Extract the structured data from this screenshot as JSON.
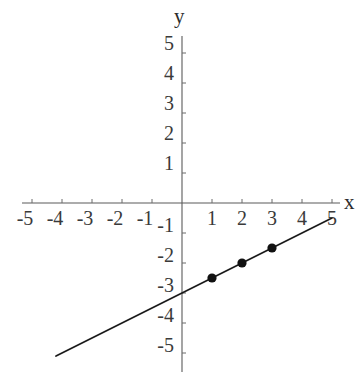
{
  "chart_data": {
    "type": "line",
    "title": "",
    "xlabel": "x",
    "ylabel": "y",
    "xlim": [
      -5,
      5
    ],
    "ylim": [
      -5,
      5
    ],
    "grid": false,
    "legend": "none",
    "equation": "y = 0.5x - 3",
    "slope": 0.5,
    "intercept": -3,
    "line_endpoints": [
      {
        "x": -4.2,
        "y": -5.1
      },
      {
        "x": 5.0,
        "y": -0.5
      }
    ],
    "x": [
      1,
      2,
      3
    ],
    "values": [
      -2.5,
      -2,
      -1.5
    ],
    "series": [
      {
        "name": "y = 0.5x - 3",
        "points": [
          {
            "x": 1,
            "y": -2.5
          },
          {
            "x": 2,
            "y": -2
          },
          {
            "x": 3,
            "y": -1.5
          }
        ]
      }
    ],
    "x_tick_labels": [
      "-5",
      "-4",
      "-3",
      "-2",
      "-1",
      "1",
      "2",
      "3",
      "4",
      "5"
    ],
    "x_tick_values": [
      -5,
      -4,
      -3,
      -2,
      -1,
      1,
      2,
      3,
      4,
      5
    ],
    "y_tick_labels": [
      "5",
      "4",
      "3",
      "2",
      "1",
      "-1",
      "-2",
      "-3",
      "-4",
      "-5"
    ],
    "y_tick_values": [
      5,
      4,
      3,
      2,
      1,
      -1,
      -2,
      -3,
      -4,
      -5
    ],
    "colors": {
      "line": "#1a1a1a",
      "point": "#111111",
      "axis": "#5a5a5a",
      "label": "#3a3a3a",
      "background": "#ffffff"
    }
  },
  "axis_titles": {
    "x": "x",
    "y": "y"
  }
}
